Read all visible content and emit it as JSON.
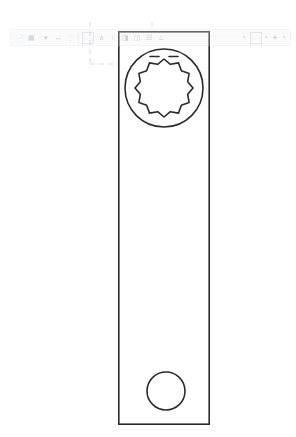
{
  "app": {
    "background_color": "#ffffff",
    "canvas_name": "cad-2d-sketch-view"
  },
  "drawing": {
    "title": "Wrench Body Profile",
    "line_color": "#2b2b2b",
    "fill_color": "#ffffff",
    "construction_line_color": "#c9c9cf",
    "stroke_width": 1.6,
    "units": "px",
    "body": {
      "shape": "rectangle",
      "name": "wrench-body-outline",
      "x": 118,
      "y": 31,
      "width": 92,
      "height": 394
    },
    "socket": {
      "name": "twelve-point-socket",
      "center_x": 164,
      "center_y": 88,
      "outer_radius": 39,
      "inner_radius": 29,
      "point_count": 12,
      "lobe_depth": 4.5,
      "chamfer_marks": 2
    },
    "pin_hole": {
      "name": "pin-hole-circle",
      "center_x": 166,
      "center_y": 391,
      "radius": 19
    },
    "construction": {
      "name": "construction-guides",
      "style": "dashed",
      "segments": [
        {
          "x1": 90,
          "y1": 22,
          "x2": 90,
          "y2": 68
        },
        {
          "x1": 122,
          "y1": 22,
          "x2": 122,
          "y2": 22
        },
        {
          "x1": 152,
          "y1": 22,
          "x2": 152,
          "y2": 30
        },
        {
          "x1": 90,
          "y1": 64,
          "x2": 120,
          "y2": 64
        },
        {
          "x1": 66,
          "y1": 38,
          "x2": 118,
          "y2": 38
        }
      ]
    }
  },
  "toolbar": {
    "name": "ghosted-overlay-toolbar",
    "opacity": 0.42,
    "legible": false,
    "note": "Semi-transparent ghost artifact; labels are not readable in the source pixels.",
    "items": [
      {
        "icon": "file-icon",
        "label": ""
      },
      {
        "icon": "layers-icon",
        "label": ""
      },
      {
        "icon": "dropdown-icon",
        "label": ""
      },
      {
        "icon": "measure-icon",
        "label": ""
      },
      {
        "icon": "dimension-icon",
        "label": ""
      },
      {
        "icon": "line-tool-icon",
        "label": ""
      },
      {
        "icon": "arc-tool-icon",
        "label": ""
      },
      {
        "icon": "circle-tool-icon",
        "label": ""
      },
      {
        "icon": "trim-tool-icon",
        "label": ""
      },
      {
        "icon": "mirror-tool-icon",
        "label": ""
      },
      {
        "icon": "pattern-icon",
        "label": ""
      },
      {
        "icon": "constraint-icon",
        "label": ""
      },
      {
        "icon": "grid-icon",
        "label": ""
      },
      {
        "icon": "snap-icon",
        "label": ""
      }
    ]
  }
}
